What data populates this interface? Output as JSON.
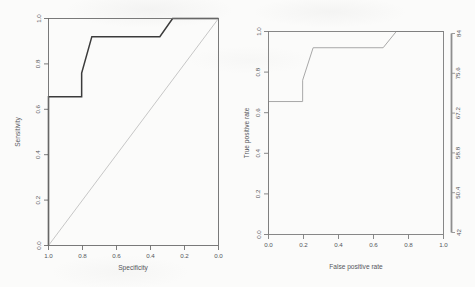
{
  "figure": {
    "background_color": "#fbfbfa",
    "panel_count": 2
  },
  "chart_data": [
    {
      "type": "line",
      "panel": "left",
      "title": "",
      "xlabel": "Specificity",
      "ylabel": "Sensitivity",
      "xlim": [
        1.0,
        0.0
      ],
      "ylim": [
        0.0,
        1.0
      ],
      "x_reversed": true,
      "grid": false,
      "legend": null,
      "xticks": [
        "1.0",
        "0.8",
        "0.6",
        "0.4",
        "0.2",
        "0.0"
      ],
      "xtick_values": [
        1.0,
        0.8,
        0.6,
        0.4,
        0.2,
        0.0
      ],
      "yticks": [
        "0.0",
        "0.2",
        "0.4",
        "0.6",
        "0.8",
        "1.0"
      ],
      "ytick_values": [
        0.0,
        0.2,
        0.4,
        0.6,
        0.8,
        1.0
      ],
      "series": [
        {
          "name": "ROC curve",
          "color": "#3b3b3b",
          "width": 1.5,
          "specificity": [
            1.0,
            1.0,
            0.805,
            0.805,
            0.745,
            0.345,
            0.27,
            0.0
          ],
          "sensitivity": [
            0.0,
            0.655,
            0.655,
            0.76,
            0.92,
            0.92,
            1.0,
            1.0
          ]
        },
        {
          "name": "chance diagonal",
          "color": "#b9b9b9",
          "width": 0.8,
          "specificity": [
            1.0,
            0.0
          ],
          "sensitivity": [
            0.0,
            1.0
          ]
        }
      ]
    },
    {
      "type": "line",
      "panel": "right",
      "title": "",
      "xlabel": "False positive rate",
      "ylabel": "True positive rate",
      "xlim": [
        0.0,
        1.0
      ],
      "ylim": [
        0.0,
        1.0
      ],
      "x_reversed": false,
      "grid": false,
      "legend": null,
      "xticks": [
        "0.0",
        "0.2",
        "0.4",
        "0.6",
        "0.8",
        "1.0"
      ],
      "xtick_values": [
        0.0,
        0.2,
        0.4,
        0.6,
        0.8,
        1.0
      ],
      "yticks": [
        "0.0",
        "0.2",
        "0.4",
        "0.6",
        "0.8",
        "1.0"
      ],
      "ytick_values": [
        0.0,
        0.2,
        0.4,
        0.6,
        0.8,
        1.0
      ],
      "right_axis": {
        "name": "threshold scale",
        "ticks": [
          "42",
          "50.4",
          "58.8",
          "67.2",
          "75.6",
          "84"
        ],
        "tick_values": [
          42,
          50.4,
          58.8,
          67.2,
          75.6,
          84
        ],
        "color": "#8e8e8e"
      },
      "series": [
        {
          "name": "ROC curve",
          "color": "#a8a8a8",
          "width": 1.0,
          "fpr": [
            0.0,
            0.0,
            0.195,
            0.195,
            0.255,
            0.655,
            0.73,
            1.0
          ],
          "tpr": [
            0.0,
            0.655,
            0.655,
            0.76,
            0.92,
            0.92,
            1.0,
            1.0
          ]
        }
      ]
    }
  ]
}
